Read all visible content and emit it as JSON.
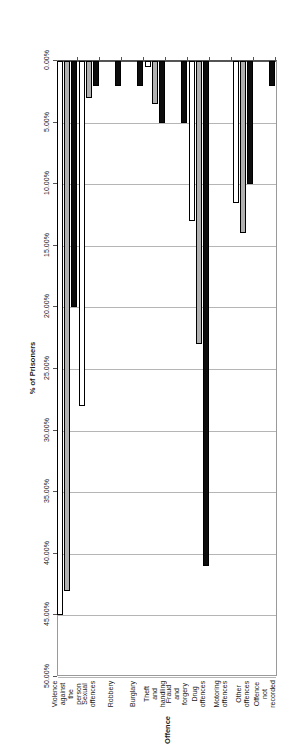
{
  "chart_data": {
    "type": "bar",
    "orientation": "horizontal",
    "title": "",
    "xlabel": "Offence",
    "ylabel": "% of Prisoners",
    "categories": [
      "Violence against the person",
      "Sexual offences",
      "Robbery",
      "Burglary",
      "Theft and handling",
      "Fraud and forgery",
      "Drug offences",
      "Motoring offences",
      "Other offences",
      "Offence not recorded"
    ],
    "series": [
      {
        "name": "50-59",
        "color": "#0d0d0d",
        "values": [
          20.0,
          2.0,
          2.0,
          2.0,
          5.0,
          5.0,
          41.0,
          0.0,
          10.0,
          2.0
        ]
      },
      {
        "name": "60-69",
        "color": "#b0b0b0",
        "values": [
          43.0,
          3.0,
          0.0,
          0.0,
          3.5,
          0.0,
          23.0,
          0.0,
          14.0,
          0.0
        ]
      },
      {
        "name": "70+",
        "color": "#ffffff",
        "values": [
          45.0,
          28.0,
          0.0,
          0.0,
          0.5,
          0.0,
          13.0,
          0.0,
          11.5,
          0.0
        ]
      }
    ],
    "ticks": [
      "0.00%",
      "5.00%",
      "10.00%",
      "15.00%",
      "20.00%",
      "25.00%",
      "30.00%",
      "35.00%",
      "40.00%",
      "45.00%",
      "50.00%"
    ],
    "tick_values": [
      0,
      5,
      10,
      15,
      20,
      25,
      30,
      35,
      40,
      45,
      50
    ],
    "xlim": [
      0,
      50
    ],
    "grid": true,
    "legend_position": "top-right",
    "legend_entries": [
      "50-59",
      "60-69",
      "70+"
    ]
  }
}
